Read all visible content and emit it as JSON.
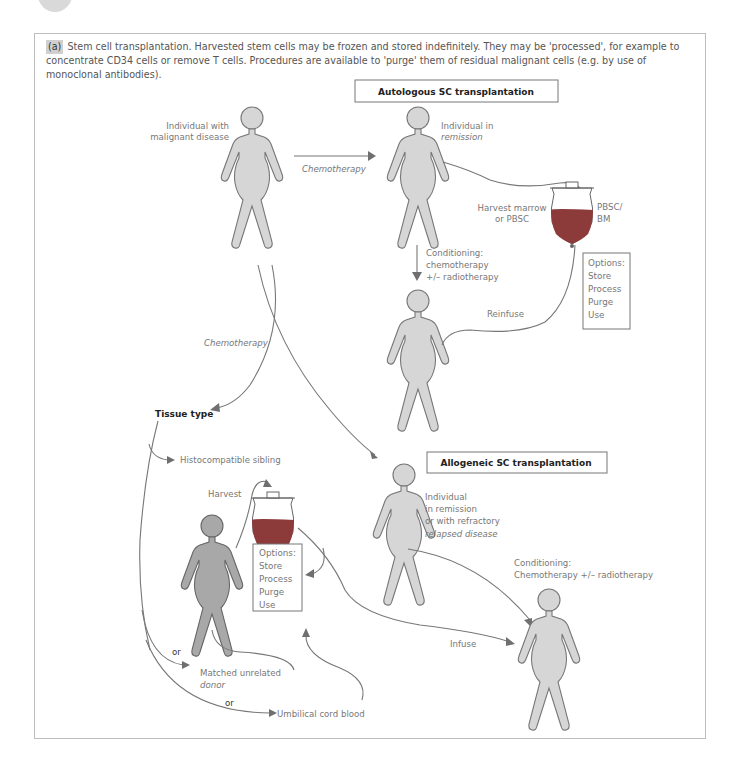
{
  "figure": {
    "panel_tag": "(a)",
    "caption": "Stem cell transplantation. Harvested stem cells may be frozen and stored indefinitely. They may be 'processed', for example to concentrate CD34 cells or remove T cells. Procedures are available to 'purge' them of residual malignant cells (e.g. by use of monoclonal antibodies)."
  },
  "autologous": {
    "title": "Autologous SC transplantation",
    "patient_label": [
      "Individual with",
      "malignant disease"
    ],
    "arrow_label": "Chemotherapy",
    "remission_label": [
      "Individual in",
      "remission"
    ],
    "harvest_label": [
      "Harvest marrow",
      "or PBSC"
    ],
    "bag_label": [
      "PBSC/",
      "BM"
    ],
    "conditioning_label": [
      "Conditioning:",
      "chemotherapy",
      "+/– radiotherapy"
    ],
    "reinfuse_label": "Reinfuse",
    "options": [
      "Options:",
      "Store",
      "Process",
      "Purge",
      "Use"
    ]
  },
  "allogeneic": {
    "title": "Allogeneic SC transplantation",
    "chemo_label": "Chemotherapy",
    "tissue_type_label": "Tissue type",
    "sibling_label": "Histocompatible sibling",
    "harvest_label": "Harvest",
    "options": [
      "Options:",
      "Store",
      "Process",
      "Purge",
      "Use"
    ],
    "recipient_label": [
      "Individual",
      "in remission",
      "or with refractory",
      "relapsed disease"
    ],
    "conditioning_label": [
      "Conditioning:",
      "Chemotherapy +/– radiotherapy"
    ],
    "infuse_label": "Infuse",
    "or_1": "or",
    "unrelated_label": [
      "Matched unrelated",
      "donor"
    ],
    "or_2": "or",
    "cord_label": "Umbilical cord blood"
  },
  "colors": {
    "body_fill": "#d6d6d6",
    "donor_fill": "#a8a8a8",
    "blood": "#8c3a3a",
    "line": "#777777"
  }
}
